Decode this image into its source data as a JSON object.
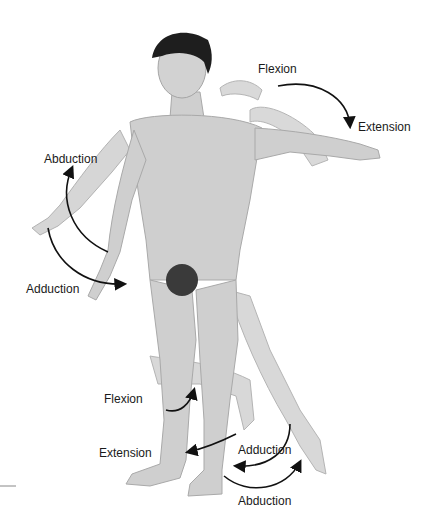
{
  "figure": {
    "labels": {
      "arm_flexion": "Flexion",
      "arm_extension": "Extension",
      "arm_abduction": "Abduction",
      "arm_adduction": "Adduction",
      "leg_flexion": "Flexion",
      "leg_extension": "Extension",
      "leg_adduction": "Adduction",
      "leg_abduction": "Abduction"
    },
    "colors": {
      "skin": "#cfcfcf",
      "skin_shadow": "#a9a9a9",
      "hair": "#1e1e1e",
      "arrow": "#111111",
      "text": "#1a1a1a",
      "background": "#ffffff"
    }
  }
}
